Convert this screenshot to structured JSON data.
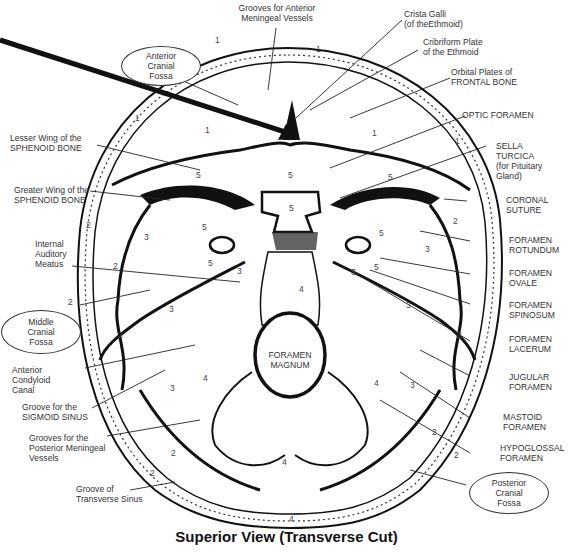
{
  "title": "Superior View  (Transverse Cut)",
  "fossae": {
    "anterior": [
      "Anterior",
      "Cranial",
      "Fossa"
    ],
    "middle": [
      "Middle",
      "Cranial",
      "Fossa"
    ],
    "posterior": [
      "Posterior",
      "Cranial",
      "Fossa"
    ]
  },
  "center_label": [
    "FORAMEN",
    "MAGNUM"
  ],
  "labels_top": {
    "grooves_anterior": [
      "Grooves for Anterior",
      "Meningeal Vessels"
    ],
    "crista_galli": [
      "Crista Galli",
      "(of theEthmoid)"
    ],
    "cribriform": [
      "Cribriform Plate",
      "of the Ethmoid"
    ],
    "orbital_plates": [
      "Orbital Plates of",
      "FRONTAL BONE"
    ]
  },
  "labels_left": {
    "lesser_wing": [
      "Lesser Wing of the",
      "SPHENOID BONE"
    ],
    "greater_wing": [
      "Greater Wing of the",
      "SPHENOID BONE"
    ],
    "internal_auditory": [
      "Internal",
      "Auditory",
      "Meatus"
    ],
    "anterior_condyloid": [
      "Anterior",
      "Condyloid",
      "Canal"
    ],
    "sigmoid_groove": [
      "Groove for the",
      "SIGMOID SINUS"
    ],
    "posterior_meningeal": [
      "Grooves for the",
      "Posterior Meningeal",
      "Vessels"
    ],
    "transverse_groove": [
      "Groove of",
      "Transverse Sinus"
    ]
  },
  "labels_right": {
    "optic": [
      "OPTIC FORAMEN"
    ],
    "sella": [
      "SELLA",
      "TURCICA",
      "(for Pituitary",
      "Gland)"
    ],
    "coronal": [
      "CORONAL",
      "SUTURE"
    ],
    "rotundum": [
      "FORAMEN",
      "ROTUNDUM"
    ],
    "ovale": [
      "FORAMEN",
      "OVALE"
    ],
    "spinosum": [
      "FORAMEN",
      "SPINOSUM"
    ],
    "lacerum": [
      "FORAMEN",
      "LACERUM"
    ],
    "jugular": [
      "JUGULAR",
      "FORAMEN"
    ],
    "mastoid": [
      "MASTOID",
      "FORAMEN"
    ],
    "hypoglossal": [
      "HYPOGLOSSAL",
      "FORAMEN"
    ]
  },
  "region_numbers": [
    {
      "n": "1",
      "x": 316,
      "y": 44
    },
    {
      "n": "1",
      "x": 135,
      "y": 113
    },
    {
      "n": "1",
      "x": 205,
      "y": 125
    },
    {
      "n": "1",
      "x": 372,
      "y": 128
    },
    {
      "n": "1",
      "x": 455,
      "y": 136
    },
    {
      "n": "1",
      "x": 215,
      "y": 35
    },
    {
      "n": "5",
      "x": 196,
      "y": 170
    },
    {
      "n": "5",
      "x": 288,
      "y": 170
    },
    {
      "n": "5",
      "x": 388,
      "y": 172
    },
    {
      "n": "5",
      "x": 289,
      "y": 203
    },
    {
      "n": "5",
      "x": 202,
      "y": 222
    },
    {
      "n": "5",
      "x": 208,
      "y": 258
    },
    {
      "n": "5",
      "x": 379,
      "y": 228
    },
    {
      "n": "5",
      "x": 374,
      "y": 262
    },
    {
      "n": "2",
      "x": 86,
      "y": 220
    },
    {
      "n": "2",
      "x": 113,
      "y": 261
    },
    {
      "n": "2",
      "x": 68,
      "y": 297
    },
    {
      "n": "2",
      "x": 118,
      "y": 330
    },
    {
      "n": "2",
      "x": 453,
      "y": 216
    },
    {
      "n": "2",
      "x": 457,
      "y": 330
    },
    {
      "n": "2",
      "x": 432,
      "y": 427
    },
    {
      "n": "2",
      "x": 454,
      "y": 450
    },
    {
      "n": "2",
      "x": 150,
      "y": 468
    },
    {
      "n": "2",
      "x": 171,
      "y": 448
    },
    {
      "n": "3",
      "x": 144,
      "y": 232
    },
    {
      "n": "3",
      "x": 169,
      "y": 304
    },
    {
      "n": "3",
      "x": 170,
      "y": 383
    },
    {
      "n": "3",
      "x": 425,
      "y": 244
    },
    {
      "n": "3",
      "x": 406,
      "y": 300
    },
    {
      "n": "3",
      "x": 410,
      "y": 380
    },
    {
      "n": "3",
      "x": 237,
      "y": 266
    },
    {
      "n": "3",
      "x": 351,
      "y": 267
    },
    {
      "n": "4",
      "x": 299,
      "y": 284
    },
    {
      "n": "4",
      "x": 203,
      "y": 373
    },
    {
      "n": "4",
      "x": 374,
      "y": 378
    },
    {
      "n": "4",
      "x": 282,
      "y": 457
    },
    {
      "n": "4",
      "x": 289,
      "y": 514
    }
  ],
  "colors": {
    "ink": "#111111",
    "paper": "#ffffff",
    "text": "#333333"
  }
}
